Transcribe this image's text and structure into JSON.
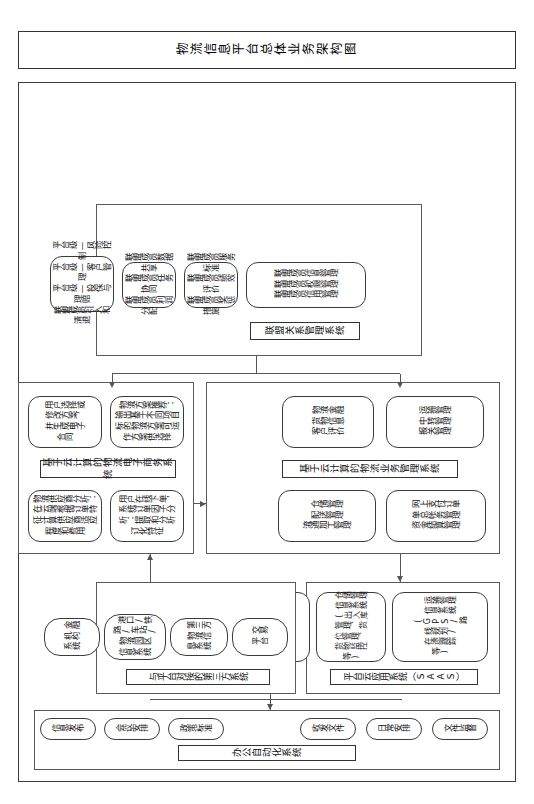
{
  "diagram": {
    "title": "物流信息平台总体业务架构图",
    "orientation": "rotated-90"
  },
  "alliance_system": {
    "title": "联盟关系管理系统",
    "nodes": [
      {
        "id": "alliance-member-mgmt",
        "text": "联盟成员信息管理\n联盟成员权限管理\n联盟成员信用管理"
      },
      {
        "id": "alliance-service-standard",
        "text": "联盟成员服务标准\n联盟成员绩效评价\n联盟成员奖惩措施"
      },
      {
        "id": "alliance-data-share",
        "text": "联盟成员数据共享\n联盟成员任务协同\n联盟成员利润分配"
      },
      {
        "id": "alliance-platform-level",
        "text": "平台级—风险控制\n平台级—客户管理\n平台级—投保与理赔\n联盟成员引入和清退"
      }
    ]
  },
  "ecommerce_system": {
    "title": "基于云计算的物流电子商务系统",
    "nodes": [
      {
        "id": "order-factor-analysis",
        "text": "用户在线下单，\n系统订单因子分\n析：提取和分析\n订化特征"
      },
      {
        "id": "supplier-analysis",
        "text": "物流供应商分析：\n在云端根据订单特\n征计算供应商适应\n程度和费用"
      },
      {
        "id": "solution-recommend",
        "text": "物流方案推荐：\n输出基于不同项目\n标的物流方案可运\n作方案供选择"
      },
      {
        "id": "user-select-contract",
        "text": "用户选择或\n修改方案，\n并生成电子\n合同"
      }
    ]
  },
  "business_system": {
    "title": "基于云计算的物流业务管理系统",
    "nodes": [
      {
        "id": "online-order-payment",
        "text": "网上支付订单\n单总帐务管理\n资金结算管理"
      },
      {
        "id": "warehouse-mgmt",
        "text": "仓储管理\n配送管理\n流通加工管理"
      },
      {
        "id": "transport-mgmt",
        "text": "运输管理\n中转管理\n报关管理"
      },
      {
        "id": "logistics-finance",
        "text": "物流金融\n货物信息\n客户评价"
      }
    ]
  },
  "third_party": {
    "title": "与平台对接的第三方系统",
    "nodes": [
      {
        "id": "exchange-platform",
        "text": "交易\n平台"
      },
      {
        "id": "third-party-logistics-info",
        "text": "第三方\n物流信\n息系统"
      },
      {
        "id": "port-rail-info",
        "text": "港口/铁\n路/车站/\n物流园区\n信息系统"
      },
      {
        "id": "financial-institution",
        "text": "金融\n机构\n系统"
      }
    ]
  },
  "saas": {
    "title": "平台云应用系统（SAAS）",
    "nodes": [
      {
        "id": "transport-info-system",
        "text": "运输管理\n信息系统\n(GPS/路\n线规划/\n在途跟踪\n等)"
      },
      {
        "id": "warehouse-info-system",
        "text": "仓储管理\n信息系统\n(出入库\n管理、货\n位管理、\n货物监控\n等)"
      },
      {
        "id": "port-info-system",
        "text": "港口信息\n系统(码\n头/堆场管\n理、吊机\n管理、港\n口计费管\n理、船舶\n管理等)"
      }
    ]
  },
  "office_automation": {
    "title": "办公自动化系统",
    "nodes": [
      {
        "id": "info-publish",
        "text": "信息发布"
      },
      {
        "id": "meeting-arrange",
        "text": "会议安排"
      },
      {
        "id": "policy-standard",
        "text": "政策标准"
      },
      {
        "id": "doc-send-receive",
        "text": "收发文件"
      },
      {
        "id": "daily-arrange",
        "text": "日常安排"
      },
      {
        "id": "doc-supervise",
        "text": "文件监督"
      }
    ]
  }
}
